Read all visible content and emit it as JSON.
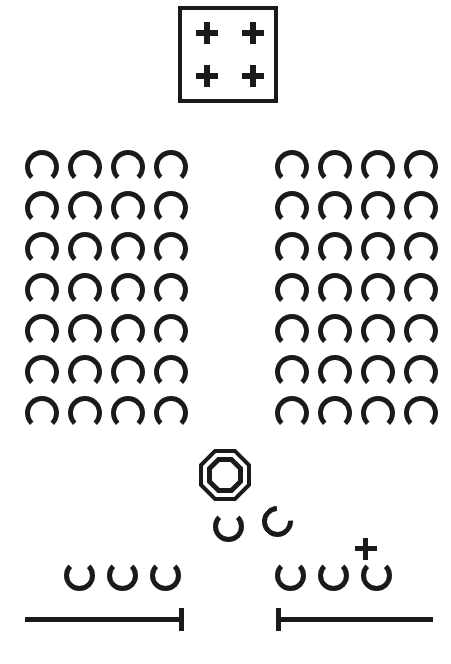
{
  "canvas": {
    "width": 451,
    "height": 664,
    "background_color": "#ffffff",
    "ink_color": "#1a1a1a",
    "description": "Abstract monochrome symbol sheet"
  },
  "plus_box": {
    "name": "bordered-square-with-four-plus-marks",
    "border_width_px": 4,
    "x": 178,
    "y": 6,
    "width": 100,
    "height": 97,
    "marks": [
      {
        "label": "+",
        "position": "top-left"
      },
      {
        "label": "+",
        "position": "top-right"
      },
      {
        "label": "+",
        "position": "bottom-left"
      },
      {
        "label": "+",
        "position": "bottom-right"
      }
    ]
  },
  "left_grid": {
    "name": "left-arch-grid",
    "glyph": "arch",
    "glyph_symbol": "∩",
    "rows": 7,
    "columns": 4,
    "total": 28,
    "x": 25,
    "y": 150,
    "col_spacing_px": 43,
    "row_spacing_px": 41
  },
  "right_grid": {
    "name": "right-arch-grid",
    "glyph": "arch",
    "glyph_symbol": "∩",
    "rows": 7,
    "columns": 4,
    "total": 28,
    "x": 275,
    "y": 150,
    "col_spacing_px": 43,
    "row_spacing_px": 41
  },
  "octagon": {
    "name": "double-octagon",
    "rings": 2,
    "x": 199,
    "y": 449,
    "size_px": 52
  },
  "mid_glyphs": [
    {
      "name": "cup-glyph",
      "glyph": "cup",
      "glyph_symbol": "∪",
      "x": 213,
      "y": 511
    },
    {
      "name": "open-ring-glyph",
      "glyph": "rotated-cup",
      "glyph_symbol": "∪",
      "rotation_deg": 42,
      "x": 262,
      "y": 506
    }
  ],
  "bottom_left_group": {
    "name": "bottom-left-cup-row",
    "glyph": "cup",
    "glyph_symbol": "∪",
    "count": 3,
    "x": 64,
    "y": 560,
    "spacing_px": 43
  },
  "bottom_right_group": {
    "name": "bottom-right-cup-row",
    "glyph": "cup",
    "glyph_symbol": "∪",
    "count": 3,
    "x": 275,
    "y": 560,
    "spacing_px": 43,
    "plus_mark": {
      "label": "+",
      "x": 355,
      "y": 538
    }
  },
  "rules": [
    {
      "name": "bottom-left-rule",
      "line": {
        "x": 25,
        "y": 617,
        "width": 158,
        "thickness": 5
      },
      "tick": {
        "x": 179,
        "y": 608,
        "width": 5,
        "height": 23,
        "side": "right"
      }
    },
    {
      "name": "bottom-right-rule",
      "line": {
        "x": 276,
        "y": 617,
        "width": 157,
        "thickness": 5
      },
      "tick": {
        "x": 276,
        "y": 608,
        "width": 5,
        "height": 23,
        "side": "left"
      }
    }
  ]
}
